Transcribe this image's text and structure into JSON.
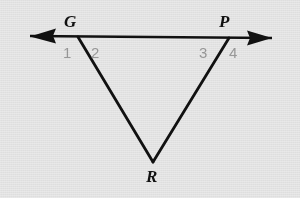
{
  "figure": {
    "type": "geometry-diagram",
    "background_color": "#e9e9e9",
    "stroke_color": "#111111",
    "label_color": "#111111",
    "numeral_color": "#9a9a9a",
    "points": [
      {
        "name": "G",
        "label": "G",
        "x": 78,
        "y": 37,
        "label_x": 64,
        "label_y": 13
      },
      {
        "name": "P",
        "label": "P",
        "x": 229,
        "y": 38,
        "label_x": 219,
        "label_y": 13
      },
      {
        "name": "R",
        "label": "R",
        "x": 153,
        "y": 162,
        "label_x": 146,
        "label_y": 168
      }
    ],
    "transversal": {
      "name": "line-through-G-P",
      "x1": 30,
      "y1": 36,
      "x2": 272,
      "y2": 38,
      "arrow_start": true,
      "arrow_end": true
    },
    "segments": [
      {
        "name": "segment-GR",
        "from": "G",
        "to": "R"
      },
      {
        "name": "segment-PR",
        "from": "P",
        "to": "R"
      }
    ],
    "angles": [
      {
        "name": "angle-1",
        "label": "1",
        "x": 63,
        "y": 45
      },
      {
        "name": "angle-2",
        "label": "2",
        "x": 91,
        "y": 45
      },
      {
        "name": "angle-3",
        "label": "3",
        "x": 199,
        "y": 45
      },
      {
        "name": "angle-4",
        "label": "4",
        "x": 229,
        "y": 45
      }
    ]
  }
}
